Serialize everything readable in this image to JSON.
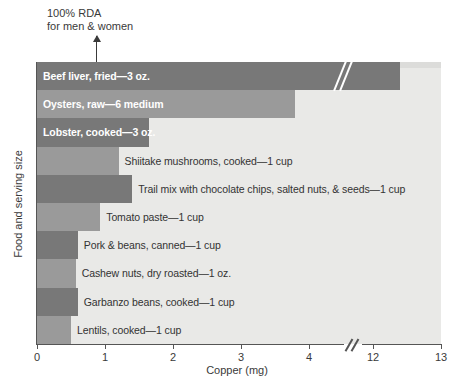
{
  "chart_data": {
    "type": "bar",
    "orientation": "horizontal",
    "title": "",
    "xlabel": "Copper (mg)",
    "ylabel": "Food and serving size",
    "xlim": [
      0,
      13
    ],
    "grid": false,
    "legend": null,
    "axis_break": {
      "from": 4,
      "to": 12,
      "label": "//"
    },
    "tick_labels": [
      "0",
      "1",
      "2",
      "3",
      "4",
      "12",
      "13"
    ],
    "tick_values": [
      0,
      1,
      2,
      3,
      4,
      12,
      13
    ],
    "annotation": {
      "line1": "100% RDA",
      "line2": "for men & women",
      "value": 0.9,
      "marker": "up-arrow"
    },
    "categories": [
      "Beef liver, fried—3 oz.",
      "Oysters, raw—6 medium",
      "Lobster, cooked—3 oz.",
      "Shiitake mushrooms, cooked—1 cup",
      "Trail mix with chocolate chips, salted nuts, & seeds—1 cup",
      "Tomato paste—1 cup",
      "Pork & beans, canned—1 cup",
      "Cashew nuts, dry roasted—1 oz.",
      "Garbanzo beans, cooked—1 cup",
      "Lentils, cooked—1 cup"
    ],
    "values": [
      12.4,
      3.8,
      1.65,
      1.2,
      1.4,
      0.93,
      0.6,
      0.57,
      0.6,
      0.5
    ],
    "bars": [
      {
        "label": "Beef liver, fried—3 oz.",
        "value": 12.4,
        "shade": "dark",
        "label_inside": true,
        "has_break": true
      },
      {
        "label": "Oysters, raw—6 medium",
        "value": 3.8,
        "shade": "mid",
        "label_inside": true,
        "has_break": false
      },
      {
        "label": "Lobster, cooked—3 oz.",
        "value": 1.65,
        "shade": "dark",
        "label_inside": true,
        "has_break": false
      },
      {
        "label": "Shiitake mushrooms, cooked—1 cup",
        "value": 1.2,
        "shade": "mid",
        "label_inside": false,
        "has_break": false
      },
      {
        "label": "Trail mix with chocolate chips, salted nuts, & seeds—1 cup",
        "value": 1.4,
        "shade": "dark",
        "label_inside": false,
        "has_break": false
      },
      {
        "label": "Tomato paste—1 cup",
        "value": 0.93,
        "shade": "mid",
        "label_inside": false,
        "has_break": false
      },
      {
        "label": "Pork & beans, canned—1 cup",
        "value": 0.6,
        "shade": "dark",
        "label_inside": false,
        "has_break": false
      },
      {
        "label": "Cashew nuts, dry roasted—1 oz.",
        "value": 0.57,
        "shade": "mid",
        "label_inside": false,
        "has_break": false
      },
      {
        "label": "Garbanzo beans, cooked—1 cup",
        "value": 0.6,
        "shade": "dark",
        "label_inside": false,
        "has_break": false
      },
      {
        "label": "Lentils, cooked—1 cup",
        "value": 0.5,
        "shade": "mid",
        "label_inside": false,
        "has_break": false
      }
    ],
    "colors": {
      "bar_dark": "#787878",
      "bar_mid": "#9a9a9a",
      "plot_background": "#e9e9e7",
      "axis": "#555555",
      "text": "#3a3a3a",
      "inside_label": "#ffffff"
    }
  }
}
